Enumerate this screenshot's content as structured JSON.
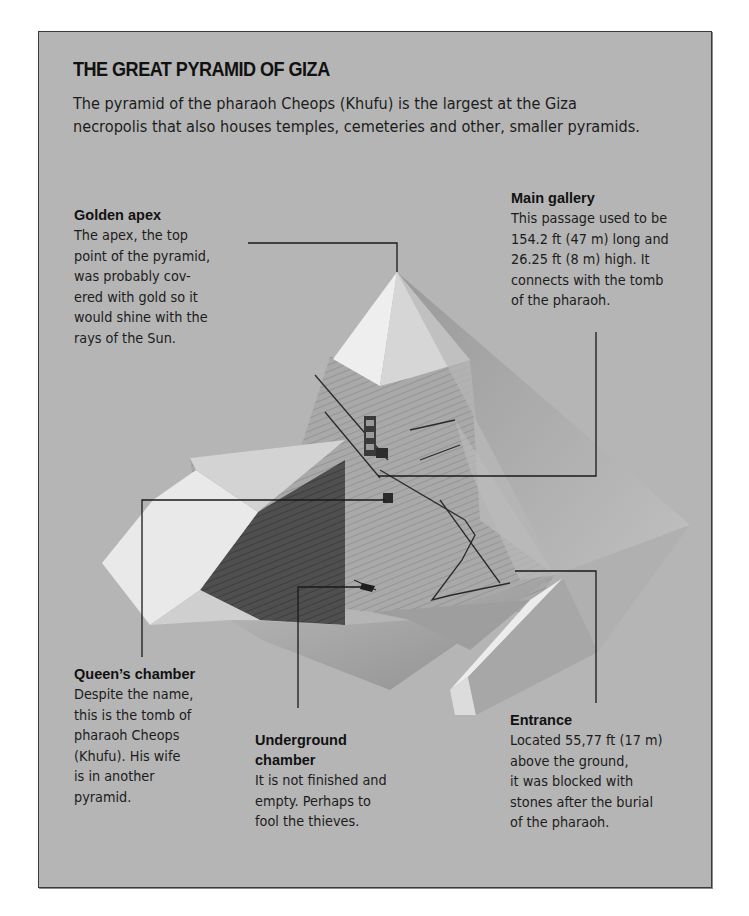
{
  "header": {
    "title": "THE GREAT PYRAMID OF GIZA",
    "intro": "The pyramid of the pharaoh Cheops (Khufu) is the largest at the Giza necropolis that also houses temples, cemeteries and other, smaller pyramids."
  },
  "callouts": {
    "golden_apex": {
      "title": "Golden apex",
      "lines": [
        "The apex, the top",
        "point of the pyramid,",
        "was probably cov-",
        "ered with gold so it",
        "would shine with the",
        "rays of the Sun."
      ]
    },
    "main_gallery": {
      "title": "Main gallery",
      "lines": [
        "This passage used to be",
        "154.2 ft (47 m) long and",
        "26.25 ft (8 m) high. It",
        "connects with the tomb",
        "of the pharaoh."
      ]
    },
    "queens_chamber": {
      "title": "Queen’s chamber",
      "lines": [
        "Despite the name,",
        "this is the tomb of",
        "pharaoh Cheops",
        "(Khufu). His wife",
        "is in another",
        "pyramid."
      ]
    },
    "underground_chamber": {
      "title_lines": [
        "Underground",
        "chamber"
      ],
      "lines": [
        "It is not finished and",
        "empty. Perhaps to",
        "fool the thieves."
      ]
    },
    "entrance": {
      "title": "Entrance",
      "lines": [
        "Located 55,77 ft (17 m)",
        "above the ground,",
        "it was blocked with",
        "stones after the burial",
        "of the pharaoh."
      ]
    }
  },
  "illustration": {
    "subject": "cut-away-pyramid",
    "colors": {
      "background": "#b5b5b5",
      "frame_border": "#3a3a3a",
      "leader_line": "#1a1a1a",
      "face_light": "#e6e6e6",
      "face_shadow": "#4a4a4a",
      "stone": "#a8a8a8"
    }
  }
}
